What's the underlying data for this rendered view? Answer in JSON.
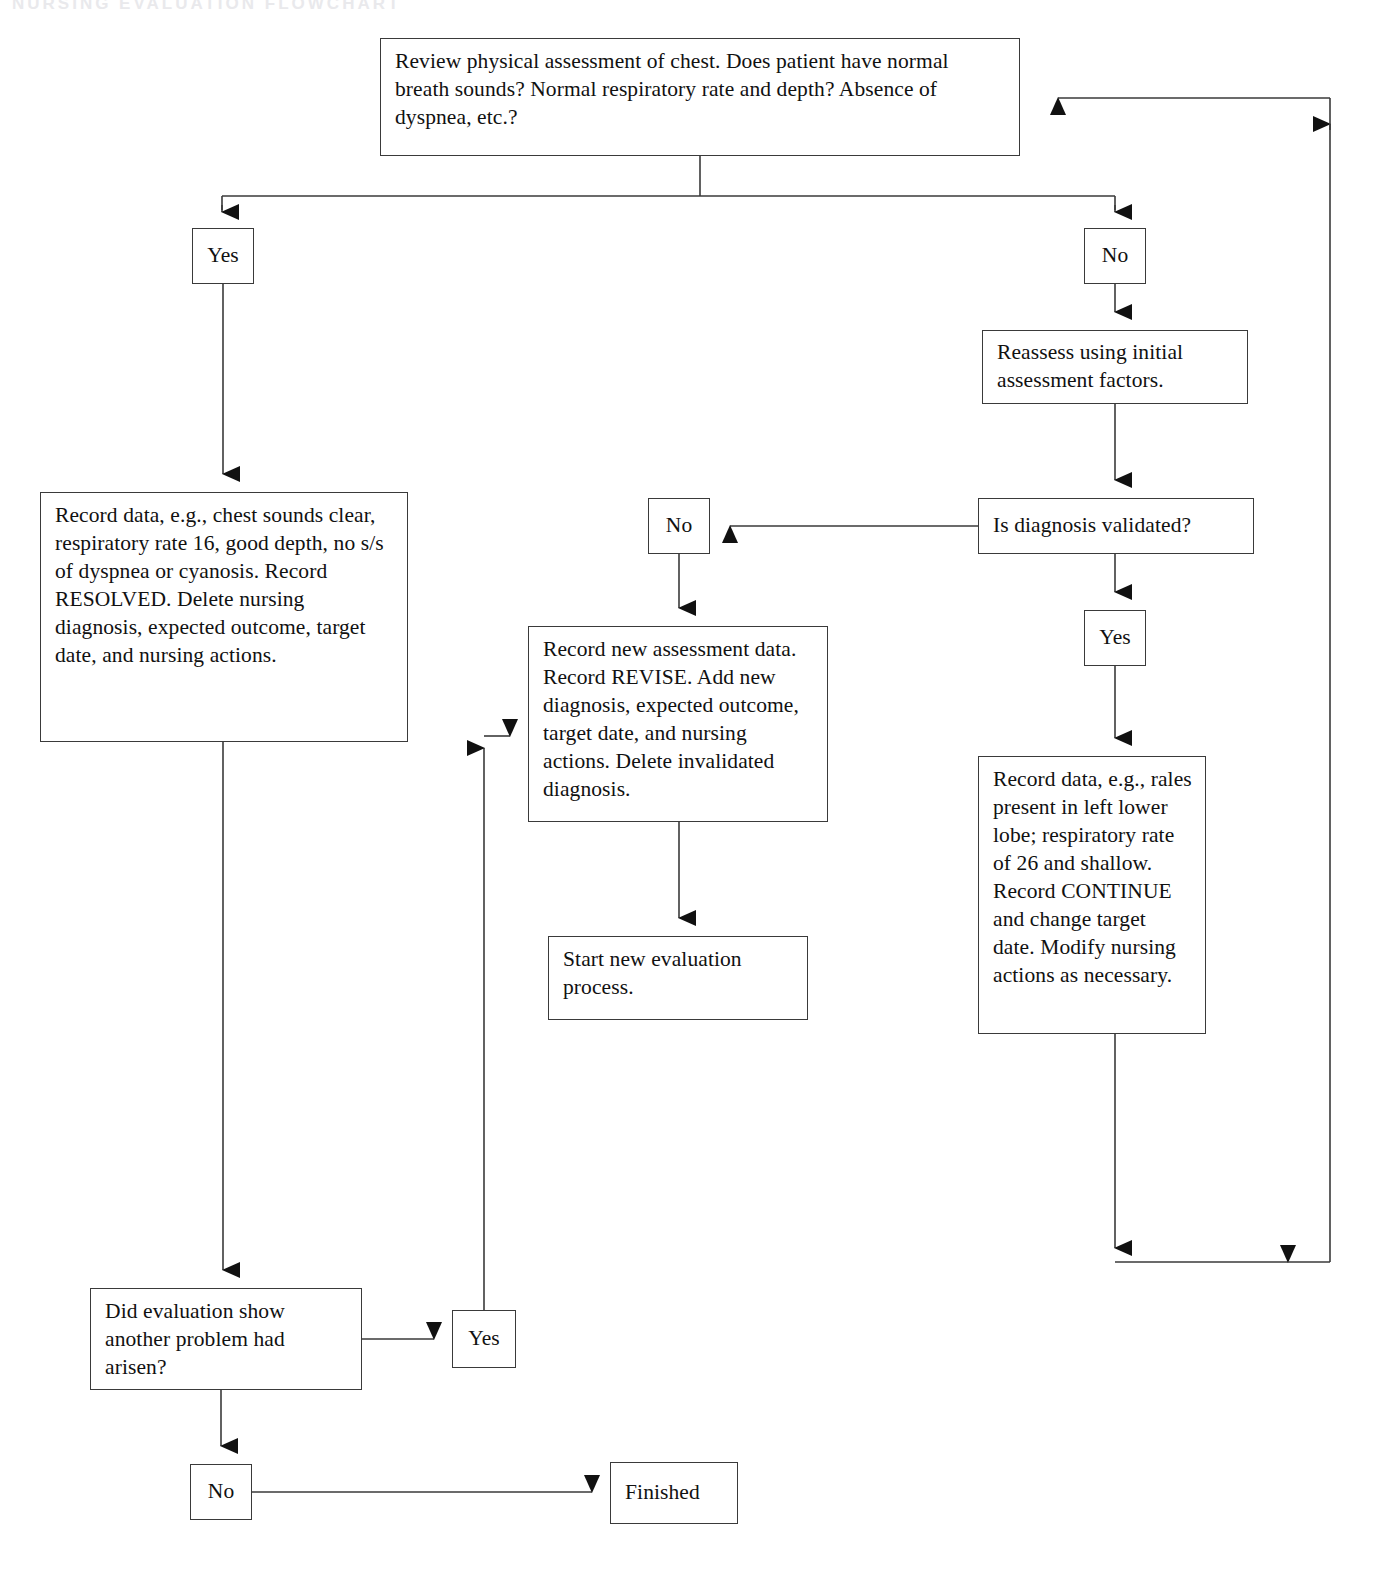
{
  "page": {
    "title": "Nursing evaluation flowchart",
    "background_color": "#ffffff",
    "line_color": "#3a3a3a",
    "text_color": "#111111",
    "faint_header_text": "NURSING EVALUATION FLOWCHART"
  },
  "nodes": {
    "review_assessment": {
      "text": "Review physical assessment of chest. Does patient have normal breath sounds? Normal respiratory rate and depth? Absence of dyspnea, etc.?",
      "x": 380,
      "y": 38,
      "w": 640,
      "h": 118
    },
    "yes_top_left": {
      "text": "Yes",
      "x": 192,
      "y": 228,
      "w": 62,
      "h": 56
    },
    "no_top_right": {
      "text": "No",
      "x": 1084,
      "y": 228,
      "w": 62,
      "h": 56
    },
    "reassess": {
      "text": "Reassess using initial assessment factors.",
      "x": 982,
      "y": 330,
      "w": 266,
      "h": 74
    },
    "record_resolved": {
      "text": "Record data, e.g., chest sounds clear, respiratory rate 16, good depth, no s/s of dyspnea or cyanosis. Record RESOLVED. Delete nursing diagnosis, expected outcome, target date, and nursing actions.",
      "x": 40,
      "y": 492,
      "w": 368,
      "h": 250
    },
    "is_diagnosis_validated": {
      "text": "Is diagnosis validated?",
      "x": 978,
      "y": 498,
      "w": 276,
      "h": 56
    },
    "no_middle": {
      "text": "No",
      "x": 648,
      "y": 498,
      "w": 62,
      "h": 56
    },
    "yes_right": {
      "text": "Yes",
      "x": 1084,
      "y": 610,
      "w": 62,
      "h": 56
    },
    "record_revise": {
      "text": "Record new assessment data. Record REVISE. Add new diagnosis, expected outcome, target date, and nursing actions. Delete invalidated diagnosis.",
      "x": 528,
      "y": 626,
      "w": 300,
      "h": 196
    },
    "record_continue": {
      "text": "Record data, e.g., rales present in left lower lobe; respiratory rate of 26 and shallow. Record CONTINUE and change target date. Modify nursing actions as necessary.",
      "x": 978,
      "y": 756,
      "w": 228,
      "h": 278
    },
    "start_new_process": {
      "text": "Start new evaluation process.",
      "x": 548,
      "y": 936,
      "w": 260,
      "h": 84
    },
    "did_evaluation_show": {
      "text": "Did evaluation show another problem had arisen?",
      "x": 90,
      "y": 1288,
      "w": 272,
      "h": 102
    },
    "yes_bottom": {
      "text": "Yes",
      "x": 452,
      "y": 1310,
      "w": 64,
      "h": 58
    },
    "no_bottom": {
      "text": "No",
      "x": 190,
      "y": 1464,
      "w": 62,
      "h": 56
    },
    "finished": {
      "text": "Finished",
      "x": 610,
      "y": 1462,
      "w": 128,
      "h": 62
    }
  },
  "edges": [
    {
      "name": "review-to-split-stub",
      "from": "review_assessment",
      "to": "split-bar"
    },
    {
      "name": "split-to-yes-top-left",
      "from": "split-bar",
      "to": "yes_top_left",
      "arrow": "down"
    },
    {
      "name": "split-to-no-top-right",
      "from": "split-bar",
      "to": "no_top_right",
      "arrow": "down"
    },
    {
      "name": "yes-top-left-to-record-resolved",
      "from": "yes_top_left",
      "to": "record_resolved",
      "arrow": "down"
    },
    {
      "name": "no-top-right-to-reassess",
      "from": "no_top_right",
      "to": "reassess",
      "arrow": "down"
    },
    {
      "name": "reassess-to-validated",
      "from": "reassess",
      "to": "is_diagnosis_validated",
      "arrow": "down"
    },
    {
      "name": "validated-to-no-middle",
      "from": "is_diagnosis_validated",
      "to": "no_middle",
      "arrow": "left"
    },
    {
      "name": "validated-to-yes-right",
      "from": "is_diagnosis_validated",
      "to": "yes_right",
      "arrow": "down"
    },
    {
      "name": "no-middle-to-record-revise",
      "from": "no_middle",
      "to": "record_revise",
      "arrow": "down"
    },
    {
      "name": "yes-right-to-record-continue",
      "from": "yes_right",
      "to": "record_continue",
      "arrow": "down"
    },
    {
      "name": "record-revise-to-start-new-process",
      "from": "record_revise",
      "to": "start_new_process",
      "arrow": "down"
    },
    {
      "name": "record-resolved-to-did-evaluation",
      "from": "record_resolved",
      "to": "did_evaluation_show",
      "arrow": "down"
    },
    {
      "name": "did-evaluation-to-yes-bottom",
      "from": "did_evaluation_show",
      "to": "yes_bottom",
      "arrow": "right"
    },
    {
      "name": "did-evaluation-to-no-bottom",
      "from": "did_evaluation_show",
      "to": "no_bottom",
      "arrow": "down"
    },
    {
      "name": "no-bottom-to-finished",
      "from": "no_bottom",
      "to": "finished",
      "arrow": "right"
    },
    {
      "name": "yes-bottom-to-record-revise-loop",
      "from": "yes_bottom",
      "to": "record_revise",
      "arrow": "up-right"
    },
    {
      "name": "record-continue-return-loop",
      "from": "record_continue",
      "to": "review_assessment",
      "arrow": "down-right-up-left"
    }
  ]
}
